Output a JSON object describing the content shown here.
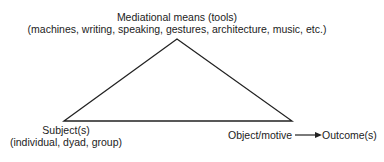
{
  "diagram": {
    "top_node": {
      "title": "Mediational means (tools)",
      "subtitle": "(machines, writing, speaking, gestures, architecture, music, etc.)"
    },
    "left_node": {
      "title": "Subject(s)",
      "subtitle": "(individual, dyad, group)"
    },
    "right_node": {
      "title": "Object/motive",
      "outcome": "Outcome(s)"
    },
    "shape": "triangle",
    "edges": [
      {
        "from": "Mediational means (tools)",
        "to": "Subject(s)"
      },
      {
        "from": "Mediational means (tools)",
        "to": "Object/motive"
      },
      {
        "from": "Subject(s)",
        "to": "Object/motive"
      },
      {
        "from": "Object/motive",
        "to": "Outcome(s)",
        "arrow": true
      }
    ],
    "line_color": "#222222"
  }
}
